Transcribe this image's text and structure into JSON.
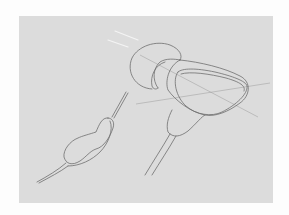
{
  "illustration": {
    "subject": "earphone sketch",
    "background_color": "#dcdcdc",
    "line_color": "#6e6e6e",
    "parts": [
      "ear-tip",
      "earphone-body",
      "nozzle",
      "cable",
      "inline-remote",
      "direction-arrows",
      "guide-lines"
    ]
  }
}
